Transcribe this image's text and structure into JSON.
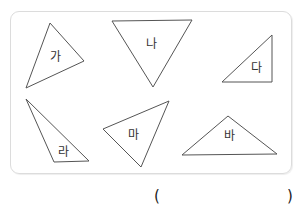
{
  "figure": {
    "triangles": [
      {
        "label": "가",
        "points": "50,23 84,61 26,88",
        "label_pos": [
          55,
          57
        ]
      },
      {
        "label": "나",
        "points": "112,21 192,20 153,87",
        "label_pos": [
          151,
          44
        ]
      },
      {
        "label": "다",
        "points": "272,35 272,82 222,82",
        "label_pos": [
          256,
          68
        ]
      },
      {
        "label": "라",
        "points": "26,99 89,161 54,162",
        "label_pos": [
          63,
          152
        ]
      },
      {
        "label": "마",
        "points": "169,101 103,129 141,167",
        "label_pos": [
          133,
          135
        ]
      },
      {
        "label": "바",
        "points": "228,116 182,155 277,154",
        "label_pos": [
          229,
          136
        ]
      }
    ],
    "stroke_color": "#555555",
    "border_color": "#dcdcdc"
  },
  "answer": {
    "open_paren": "(",
    "close_paren": ")",
    "value": ""
  }
}
